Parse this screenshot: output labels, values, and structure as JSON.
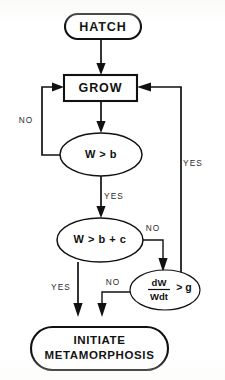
{
  "diagram": {
    "type": "flowchart",
    "background_color": "#ffffff",
    "line_color": "#111111",
    "nodes": [
      {
        "id": "hatch",
        "shape": "terminal",
        "label": "HATCH"
      },
      {
        "id": "grow",
        "shape": "process",
        "label": "GROW"
      },
      {
        "id": "w_gt_b",
        "shape": "decision-ellipse",
        "label": "W > b"
      },
      {
        "id": "w_gt_b_plus_c",
        "shape": "decision-ellipse",
        "label": "W > b + c"
      },
      {
        "id": "growth_rate",
        "shape": "decision-ellipse",
        "numerator": "dW",
        "denominator": "Wdt",
        "relation": "> g"
      },
      {
        "id": "initiate",
        "shape": "terminal",
        "label_line1": "INITIATE",
        "label_line2": "METAMORPHOSIS"
      }
    ],
    "edge_labels": {
      "w_gt_b_no": "NO",
      "w_gt_b_yes": "YES",
      "w_gt_b_plus_c_no": "NO",
      "w_gt_b_plus_c_yes": "YES",
      "growth_rate_no": "NO",
      "growth_rate_yes": "YES"
    }
  }
}
